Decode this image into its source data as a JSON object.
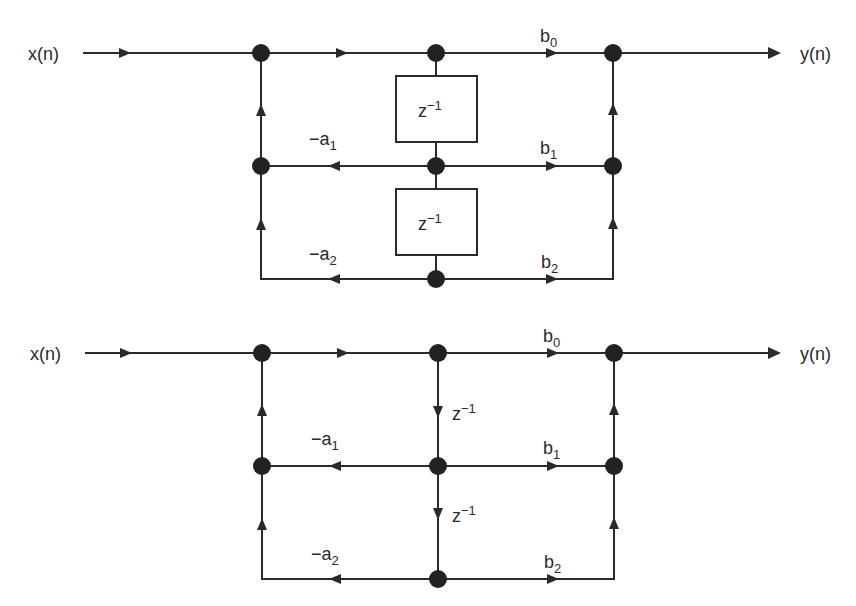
{
  "diagrams": [
    {
      "name": "direct-form-ii-block",
      "input_label": "x(n)",
      "output_label": "y(n)",
      "delay_label_base": "z",
      "delay_label_exp": "−1",
      "feedback": [
        {
          "sign": "−",
          "base": "a",
          "sub": "1"
        },
        {
          "sign": "−",
          "base": "a",
          "sub": "2"
        }
      ],
      "feedforward": [
        {
          "base": "b",
          "sub": "0"
        },
        {
          "base": "b",
          "sub": "1"
        },
        {
          "base": "b",
          "sub": "2"
        }
      ]
    },
    {
      "name": "direct-form-ii-signal-flow-graph",
      "input_label": "x(n)",
      "output_label": "y(n)",
      "delay_label_base": "z",
      "delay_label_exp": "−1",
      "feedback": [
        {
          "sign": "−",
          "base": "a",
          "sub": "1"
        },
        {
          "sign": "−",
          "base": "a",
          "sub": "2"
        }
      ],
      "feedforward": [
        {
          "base": "b",
          "sub": "0"
        },
        {
          "base": "b",
          "sub": "1"
        },
        {
          "base": "b",
          "sub": "2"
        }
      ]
    }
  ],
  "colors": {
    "line": "#2a2a2a",
    "node": "#222222",
    "background": "#ffffff"
  }
}
